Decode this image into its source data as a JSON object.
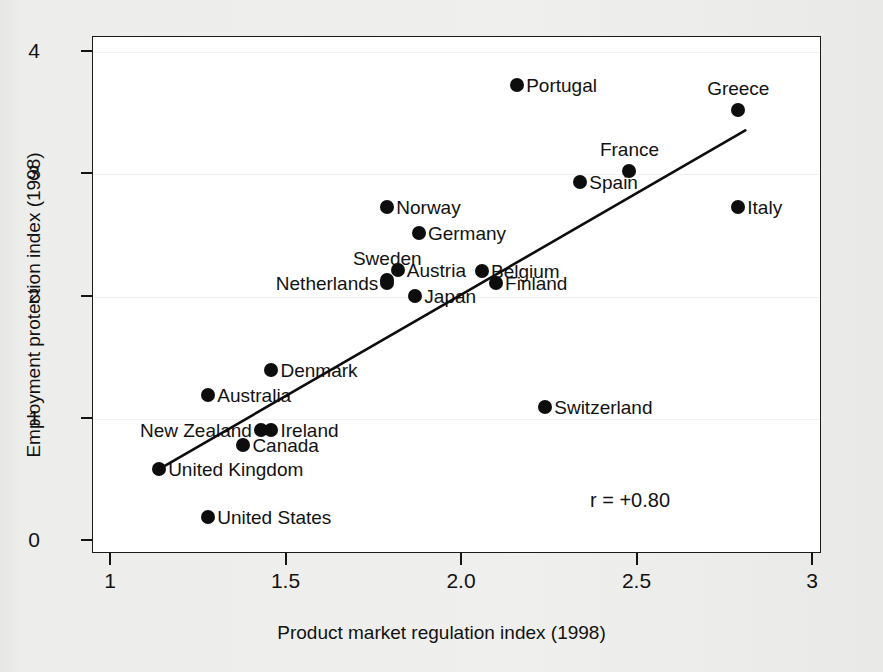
{
  "chart_data": {
    "type": "scatter",
    "title": "",
    "xlabel": "Product market regulation index (1998)",
    "ylabel": "Employment protection index (1998)",
    "xlim": [
      1,
      3
    ],
    "ylim": [
      0,
      4
    ],
    "xticks": [
      "1",
      "1.5",
      "2.0",
      "2.5",
      "3"
    ],
    "xtick_values": [
      1,
      1.5,
      2.0,
      2.5,
      3
    ],
    "yticks": [
      "0",
      "1",
      "2",
      "3",
      "4"
    ],
    "ytick_values": [
      0,
      1,
      2,
      3,
      4
    ],
    "grid": false,
    "legend": "none",
    "annotation": "r = +0.80",
    "correlation": 0.8,
    "trendline": {
      "x0": 1.14,
      "y0": 0.58,
      "x1": 2.81,
      "y1": 3.35
    },
    "points": [
      {
        "label": "Portugal",
        "x": 2.16,
        "y": 3.72,
        "pos": "right"
      },
      {
        "label": "Greece",
        "x": 2.79,
        "y": 3.52,
        "pos": "above"
      },
      {
        "label": "France",
        "x": 2.48,
        "y": 3.02,
        "pos": "above"
      },
      {
        "label": "Spain",
        "x": 2.34,
        "y": 2.93,
        "pos": "right"
      },
      {
        "label": "Italy",
        "x": 2.79,
        "y": 2.72,
        "pos": "right"
      },
      {
        "label": "Norway",
        "x": 1.79,
        "y": 2.72,
        "pos": "right"
      },
      {
        "label": "Germany",
        "x": 1.88,
        "y": 2.51,
        "pos": "right"
      },
      {
        "label": "Austria",
        "x": 1.82,
        "y": 2.21,
        "pos": "right"
      },
      {
        "label": "Sweden",
        "x": 1.79,
        "y": 2.13,
        "pos": "above"
      },
      {
        "label": "Belgium",
        "x": 2.06,
        "y": 2.2,
        "pos": "right"
      },
      {
        "label": "Netherlands",
        "x": 1.79,
        "y": 2.1,
        "pos": "left"
      },
      {
        "label": "Finland",
        "x": 2.1,
        "y": 2.1,
        "pos": "right"
      },
      {
        "label": "Japan",
        "x": 1.87,
        "y": 2.0,
        "pos": "right"
      },
      {
        "label": "Denmark",
        "x": 1.46,
        "y": 1.39,
        "pos": "right"
      },
      {
        "label": "Australia",
        "x": 1.28,
        "y": 1.19,
        "pos": "right"
      },
      {
        "label": "Switzerland",
        "x": 2.24,
        "y": 1.09,
        "pos": "right"
      },
      {
        "label": "Ireland",
        "x": 1.46,
        "y": 0.9,
        "pos": "right"
      },
      {
        "label": "New Zealand",
        "x": 1.43,
        "y": 0.9,
        "pos": "left"
      },
      {
        "label": "Canada",
        "x": 1.38,
        "y": 0.78,
        "pos": "right"
      },
      {
        "label": "United Kingdom",
        "x": 1.14,
        "y": 0.58,
        "pos": "right"
      },
      {
        "label": "United States",
        "x": 1.28,
        "y": 0.19,
        "pos": "right"
      }
    ]
  }
}
